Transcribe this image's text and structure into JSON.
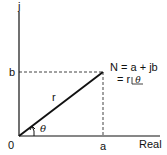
{
  "axes": {
    "vertical_label": "j",
    "horizontal_label": "Real",
    "origin_label": "0",
    "x_tick_label": "a",
    "y_tick_label": "b"
  },
  "vector": {
    "magnitude_label": "r",
    "angle_label": "θ"
  },
  "equation": {
    "line1": "N = a + jb",
    "line2_prefix": "= r ",
    "line2_angle": "θ"
  },
  "colors": {
    "line": "#111111",
    "background": "#ffffff"
  }
}
